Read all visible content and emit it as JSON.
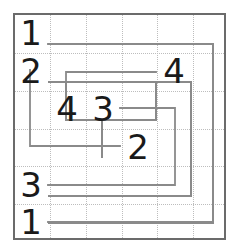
{
  "puzzle": {
    "title": "Number Loop Puzzle Grid",
    "grid": {
      "columns": 6,
      "rows": 6,
      "cell_width": 35.5,
      "cell_height": 37.8,
      "origin_x": 13,
      "origin_y": 13,
      "border_color": "#6b6b6b",
      "gridline_color": "#bdbdbd",
      "gridline_style": "dotted",
      "background": "#ffffff"
    },
    "path": {
      "stroke_color": "#8a8a8a",
      "stroke_width": 2,
      "description": "spiral-like open path drawn along cell centers"
    },
    "clues": [
      {
        "label": "1",
        "col": 0,
        "row": 0,
        "x": 20,
        "y": 16
      },
      {
        "label": "2",
        "col": 0,
        "row": 1,
        "x": 20,
        "y": 54
      },
      {
        "label": "4",
        "col": 4,
        "row": 1,
        "x": 162,
        "y": 54
      },
      {
        "label": "4",
        "col": 1,
        "row": 2,
        "x": 55,
        "y": 93
      },
      {
        "label": "3",
        "col": 2,
        "row": 2,
        "x": 89,
        "y": 93
      },
      {
        "label": "2",
        "col": 3,
        "row": 3,
        "x": 124,
        "y": 131
      },
      {
        "label": "3",
        "col": 0,
        "row": 4,
        "x": 20,
        "y": 169
      },
      {
        "label": "1",
        "col": 0,
        "row": 5,
        "x": 20,
        "y": 206
      }
    ],
    "colors": {
      "digit": "#1a1a1a",
      "border": "#6b6b6b",
      "path": "#8a8a8a",
      "gridline": "#bdbdbd",
      "page_background": "#ffffff"
    }
  }
}
